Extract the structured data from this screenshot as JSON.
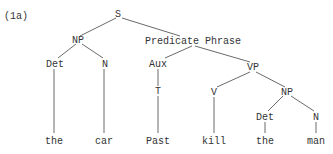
{
  "example_label": "(1a)",
  "tree": {
    "S": "S",
    "NP_subject": "NP",
    "Det_subject": "Det",
    "N_subject": "N",
    "predicate_phrase": "Predicate Phrase",
    "Aux": "Aux",
    "T": "T",
    "VP": "VP",
    "V": "V",
    "NP_object": "NP",
    "Det_object": "Det",
    "N_object": "N"
  },
  "leaves": {
    "the_1": "the",
    "car": "car",
    "past": "Past",
    "kill": "kill",
    "the_2": "the",
    "man": "man"
  }
}
